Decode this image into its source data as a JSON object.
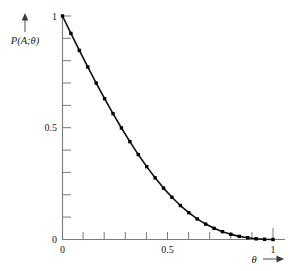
{
  "chart_data": {
    "type": "line",
    "title": "",
    "subtitle": "",
    "xlabel": "θ",
    "ylabel": "P(A;θ)",
    "xlim": [
      0,
      1
    ],
    "ylim": [
      0,
      1
    ],
    "grid": false,
    "legend": null,
    "x_ticks_major": [
      {
        "value": 0,
        "label": "0"
      },
      {
        "value": 0.5,
        "label": "0.5"
      },
      {
        "value": 1,
        "label": "1"
      }
    ],
    "y_ticks_major": [
      {
        "value": 0,
        "label": "0"
      },
      {
        "value": 0.5,
        "label": "0.5"
      },
      {
        "value": 1,
        "label": "1"
      }
    ],
    "x_ticks_minor": [
      0.1,
      0.2,
      0.3,
      0.4,
      0.6,
      0.7,
      0.8,
      0.9
    ],
    "y_ticks_minor": [
      0.1,
      0.2,
      0.3,
      0.4,
      0.6,
      0.7,
      0.8,
      0.9
    ],
    "marker_style": "filled-square",
    "line_color": "#101010",
    "axis_color": "#7a7a7a",
    "series": [
      {
        "name": "P(A;θ)",
        "x": [
          0.0,
          0.04,
          0.08,
          0.12,
          0.16,
          0.2,
          0.24,
          0.28,
          0.32,
          0.36,
          0.4,
          0.44,
          0.48,
          0.52,
          0.56,
          0.6,
          0.64,
          0.68,
          0.72,
          0.76,
          0.8,
          0.84,
          0.88,
          0.92,
          0.96,
          1.0
        ],
        "y": [
          1.0,
          0.922,
          0.846,
          0.772,
          0.7,
          0.63,
          0.563,
          0.499,
          0.438,
          0.38,
          0.326,
          0.276,
          0.23,
          0.189,
          0.152,
          0.12,
          0.092,
          0.069,
          0.05,
          0.035,
          0.023,
          0.014,
          0.008,
          0.003,
          0.001,
          0.0
        ]
      }
    ],
    "annotations": [
      {
        "text": "θ",
        "role": "x-axis-title",
        "has_arrow": true,
        "arrow_direction": "right"
      },
      {
        "text": "P(A;θ)",
        "role": "y-axis-title",
        "has_arrow": true,
        "arrow_direction": "up"
      }
    ]
  },
  "labels": {
    "y_axis_title": "P(A;θ)",
    "x_axis_title": "θ",
    "y_top": "1",
    "y_mid": "0.5",
    "y_zero": "0",
    "x_zero": "0",
    "x_mid": "0.5",
    "x_max": "1"
  }
}
